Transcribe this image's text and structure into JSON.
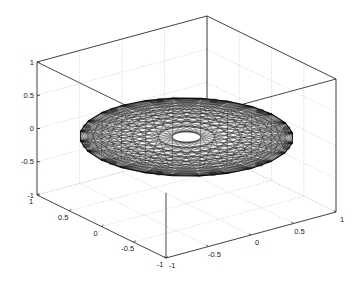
{
  "figure": {
    "background": "#ffffff",
    "axis_color": "#333333",
    "grid_color": "#bbbbbb",
    "mesh_color": "#111111"
  },
  "chart_data": {
    "type": "mesh3d",
    "title": "",
    "xlabel": "",
    "ylabel": "",
    "zlabel": "",
    "grid": true,
    "box": true,
    "xlim": [
      -1,
      1
    ],
    "ylim": [
      -1,
      1
    ],
    "zlim": [
      -1,
      1
    ],
    "x_ticks": [
      -1,
      -0.5,
      0,
      0.5,
      1
    ],
    "x_tick_labels": [
      "-1",
      "-0.5",
      "0",
      "0.5",
      "1"
    ],
    "y_ticks": [
      -1,
      -0.5,
      0,
      0.5,
      1
    ],
    "y_tick_labels": [
      "-1",
      "-0.5",
      "0",
      "0.5",
      "1"
    ],
    "z_ticks": [
      -1,
      -0.5,
      0,
      0.5,
      1
    ],
    "z_tick_labels": [
      "-1",
      "-0.5",
      "0",
      "0.5",
      "1"
    ],
    "surface": {
      "shape": "flat triangulated disk",
      "radius": 1,
      "z": 0,
      "center": [
        0,
        0,
        0
      ],
      "boundary_points": 24,
      "chord_pattern": "all boundary-to-boundary chords (mystic rose)",
      "central_hole": true
    }
  }
}
